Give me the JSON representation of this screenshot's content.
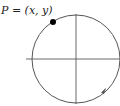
{
  "diagram": {
    "point_label": "P = (x, y)",
    "elements": {
      "circle": {
        "cx": 76,
        "cy": 59,
        "r": 44,
        "color": "#555555"
      },
      "x_axis": {
        "x1": 26,
        "x2": 120,
        "y": 59
      },
      "y_axis": {
        "x": 76,
        "y1": 14,
        "y2": 104
      },
      "point": {
        "cx": 53,
        "cy": 22,
        "r": 3,
        "color": "#000000"
      },
      "arrow": {
        "x": 104,
        "y": 91,
        "direction": "counterclockwise"
      }
    }
  }
}
